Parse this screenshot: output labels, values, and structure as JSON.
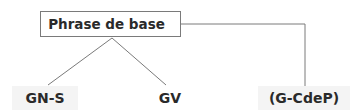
{
  "diagram": {
    "root": {
      "label": "Phrase de base"
    },
    "children": [
      {
        "label": "GN-S"
      },
      {
        "label": "GV"
      },
      {
        "label": "(G-CdeP)"
      }
    ],
    "colors": {
      "line": "#7a7a7a",
      "text": "#2a2a2a",
      "leaf_bg": "#f4f4f4"
    }
  }
}
